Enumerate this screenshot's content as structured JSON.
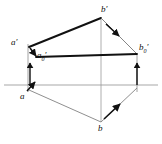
{
  "figure": {
    "type": "descriptive-geometry-projection",
    "background_color": "#ffffff",
    "ink_color": "#111111",
    "ground_line_color": "#a8a8a8",
    "thin_line_color": "#6f6f6f"
  },
  "labels": {
    "a_prime": "a′",
    "a_prime_zero_base": "a",
    "a_prime_zero_sub": "0",
    "a_prime_zero_prime": "′",
    "b_prime": "b′",
    "b_prime_zero_base": "b",
    "b_prime_zero_sub": "0",
    "b_prime_zero_prime": "′",
    "a_lower": "a",
    "b_lower": "b"
  },
  "points": {
    "a_prime": {
      "x": 28,
      "y": 43,
      "label": "a′"
    },
    "a_prime_zero": {
      "x": 36,
      "y": 56,
      "label": "a′0′"
    },
    "b_prime": {
      "x": 101,
      "y": 18,
      "label": "b′"
    },
    "b_prime_zero": {
      "x": 137,
      "y": 54,
      "label": "b′0′"
    },
    "a_lower": {
      "x": 28,
      "y": 89,
      "label": "a"
    },
    "b_lower": {
      "x": 101,
      "y": 122,
      "label": "b"
    }
  },
  "ground_line": {
    "x1": 4,
    "y1": 85,
    "x2": 158,
    "y2": 85,
    "label": ""
  },
  "segments": [
    {
      "name": "a-prime-to-b-prime",
      "weight": "thick"
    },
    {
      "name": "a-prime-zero-to-b-prime-zero",
      "weight": "thick"
    },
    {
      "name": "b-prime-to-b-prime-zero",
      "weight": "thin"
    },
    {
      "name": "a-prime-to-a-lower-vertical",
      "weight": "thin"
    },
    {
      "name": "b-prime-to-b-lower-vertical",
      "weight": "thin"
    },
    {
      "name": "b-prime-zero-to-vertical-foot",
      "weight": "thin"
    },
    {
      "name": "a-lower-to-b-lower",
      "weight": "thin"
    },
    {
      "name": "b-lower-to-right-foot",
      "weight": "thin"
    }
  ],
  "arrows": [
    {
      "name": "arrow-a-prime-to-a-prime-zero",
      "direction": "down-right"
    },
    {
      "name": "arrow-vertical-left-up",
      "direction": "up"
    },
    {
      "name": "arrow-a-lower-up-right",
      "direction": "up-right"
    },
    {
      "name": "arrow-b-prime-to-b-prime-zero",
      "direction": "down-right"
    },
    {
      "name": "arrow-vertical-right-up",
      "direction": "up"
    },
    {
      "name": "arrow-b-lower-up-right",
      "direction": "up-right"
    }
  ]
}
